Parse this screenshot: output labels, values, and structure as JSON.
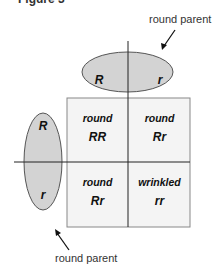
{
  "figure_title": "Figure 3",
  "top_parent": {
    "label": "round parent",
    "alleles": [
      "R",
      "r"
    ]
  },
  "left_parent": {
    "label": "round parent",
    "alleles": [
      "R",
      "r"
    ]
  },
  "grid": [
    [
      {
        "phenotype": "round",
        "genotype": "RR"
      },
      {
        "phenotype": "round",
        "genotype": "Rr"
      }
    ],
    [
      {
        "phenotype": "round",
        "genotype": "Rr"
      },
      {
        "phenotype": "wrinkled",
        "genotype": "rr"
      }
    ]
  ],
  "colors": {
    "ellipse_fill": "#d3d3d3",
    "grid_fill": "#f4f4f4",
    "line": "#222222"
  }
}
